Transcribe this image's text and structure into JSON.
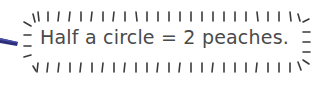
{
  "caption": {
    "text": "Half a circle = 2 peaches."
  },
  "decoration": {
    "pencil_color": "#2b2f7a",
    "tick_color": "#3a3a3a",
    "text_color": "#4a4a4a"
  }
}
